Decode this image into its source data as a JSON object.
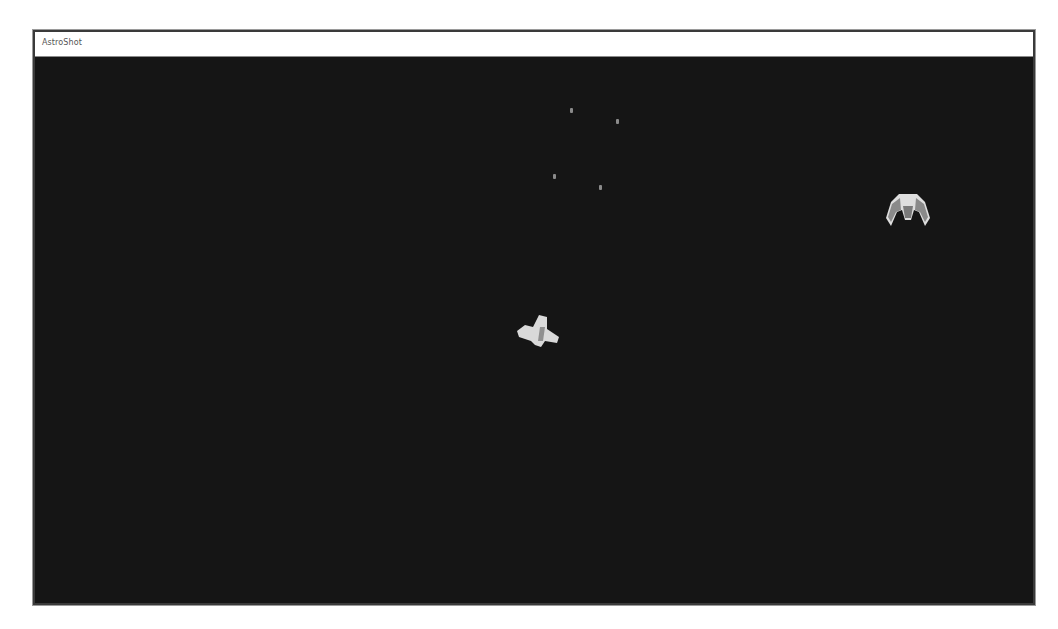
{
  "window": {
    "title": "AstroShot"
  },
  "game": {
    "background_color": "#151515",
    "player_ship": {
      "label": "player-ship",
      "x": 478,
      "y": 254,
      "color": "#d9d9d9",
      "cockpit_color": "#8f8f8f"
    },
    "enemy_ship": {
      "label": "enemy-ship",
      "x": 848,
      "y": 133,
      "color": "#dedede",
      "wing_color": "#8a8a8a"
    },
    "projectiles": [
      {
        "x": 535,
        "y": 51
      },
      {
        "x": 581,
        "y": 62
      },
      {
        "x": 518,
        "y": 117
      },
      {
        "x": 564,
        "y": 128
      }
    ]
  }
}
